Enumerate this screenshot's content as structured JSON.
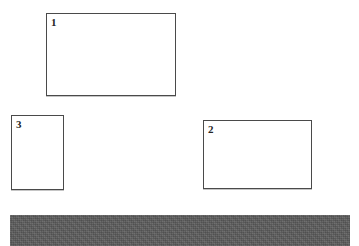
{
  "canvas": {
    "width": 359,
    "height": 246,
    "background_color": "#ffffff"
  },
  "diagram": {
    "type": "rectangles-on-ground",
    "shape_outline_color": "#4a4a4a",
    "shape_fill_color": "#ffffff",
    "label_color": "#252525",
    "shapes": [
      {
        "label": "1",
        "name": "rectangle-1",
        "x": 46,
        "y": 13,
        "width": 130,
        "height": 83
      },
      {
        "label": "3",
        "name": "rectangle-3",
        "x": 11,
        "y": 115,
        "width": 53,
        "height": 75
      },
      {
        "label": "2",
        "name": "rectangle-2",
        "x": 203,
        "y": 120,
        "width": 109,
        "height": 69
      }
    ],
    "ground_bar": {
      "name": "ground-bar",
      "x": 10,
      "y": 215,
      "width": 340,
      "height": 31,
      "color": "#5a5a5a",
      "texture": "dithered-noise"
    }
  }
}
